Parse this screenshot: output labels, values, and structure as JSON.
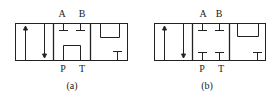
{
  "diagrams": [
    {
      "id": "a",
      "caption": "(a)",
      "ports": {
        "A": "A",
        "B": "B",
        "P": "P",
        "T": "T"
      },
      "center_position": "P connected to T (tandem/unloading), A and B blocked"
    },
    {
      "id": "b",
      "caption": "(b)",
      "ports": {
        "A": "A",
        "B": "B",
        "P": "P",
        "T": "T"
      },
      "center_position": "all ports blocked (O-type)"
    }
  ],
  "colors": {
    "stroke": "#222222",
    "background": "#ffffff"
  }
}
